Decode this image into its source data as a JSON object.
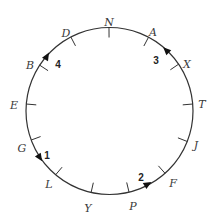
{
  "diagram": {
    "type": "circular-track",
    "circle": {
      "cx": 109.5,
      "cy": 111,
      "r": 83.5,
      "stroke": "#333333"
    },
    "points": [
      {
        "label": "N",
        "tick": [
          109,
          28
        ],
        "text": [
          109,
          22
        ]
      },
      {
        "label": "A",
        "tick": [
          146,
          42
        ],
        "text": [
          153,
          32
        ]
      },
      {
        "label": "X",
        "tick": [
          173,
          68
        ],
        "text": [
          187,
          64
        ]
      },
      {
        "label": "T",
        "tick": [
          193,
          104
        ],
        "text": [
          202,
          104
        ]
      },
      {
        "label": "J",
        "tick": [
          186,
          141
        ],
        "text": [
          196,
          145
        ]
      },
      {
        "label": "F",
        "tick": [
          163,
          171
        ],
        "text": [
          173,
          183
        ]
      },
      {
        "label": "P",
        "tick": [
          129,
          192
        ],
        "text": [
          133,
          206
        ]
      },
      {
        "label": "Y",
        "tick": [
          91,
          193
        ],
        "text": [
          88,
          208
        ]
      },
      {
        "label": "L",
        "tick": [
          58,
          172
        ],
        "text": [
          49,
          184
        ]
      },
      {
        "label": "G",
        "tick": [
          34,
          139
        ],
        "text": [
          22,
          148
        ]
      },
      {
        "label": "E",
        "tick": [
          26,
          104
        ],
        "text": [
          14,
          105
        ]
      },
      {
        "label": "B",
        "tick": [
          44,
          68
        ],
        "text": [
          30,
          65
        ]
      },
      {
        "label": "D",
        "tick": [
          74,
          43
        ],
        "text": [
          66,
          33
        ]
      }
    ],
    "arrows": [
      {
        "number": "1",
        "at": [
          40,
          158
        ],
        "dir": [
          0.55,
          0.83
        ],
        "text": [
          47,
          155
        ]
      },
      {
        "number": "2",
        "at": [
          148,
          184
        ],
        "dir": [
          0.85,
          -0.52
        ],
        "text": [
          141,
          177
        ]
      },
      {
        "number": "3",
        "at": [
          166,
          50
        ],
        "dir": [
          -0.7,
          -0.7
        ],
        "text": [
          156,
          60
        ]
      },
      {
        "number": "4",
        "at": [
          47,
          56
        ],
        "dir": [
          0.5,
          -0.86
        ],
        "text": [
          58,
          64
        ]
      }
    ]
  }
}
